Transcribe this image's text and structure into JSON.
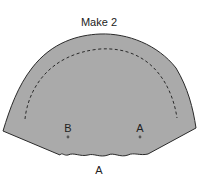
{
  "diagram": {
    "title": "Make 2",
    "piece_fill": "#aaaaaa",
    "outline_color": "#2a2a2a",
    "markers": [
      {
        "label": "B",
        "x": 68,
        "y": 137
      },
      {
        "label": "A",
        "x": 140,
        "y": 137
      }
    ],
    "bottom_label": "A"
  }
}
